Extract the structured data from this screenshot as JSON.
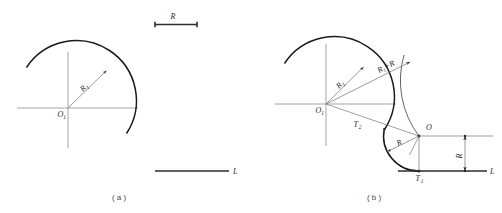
{
  "figure": {
    "watermark": "",
    "captions": {
      "left": "( a )",
      "right": "( b )"
    }
  },
  "panel_a": {
    "name": "given-elements",
    "center_label": "O",
    "center_sub": "1",
    "radius_label": "R",
    "radius_sub": "1",
    "given_radius_label": "R",
    "given_line_label": "L"
  },
  "panel_b": {
    "name": "construction-result",
    "center1_label": "O",
    "center1_sub": "1",
    "center2_label": "O",
    "radius1_label": "R",
    "radius1_sub": "1",
    "sum_radius_label": "R₁+R",
    "radius_label": "R",
    "offset_dim_label": "R",
    "tangent1_label": "T",
    "tangent1_sub": "1",
    "tangent2_label": "T",
    "tangent2_sub": "2",
    "line_label": "L"
  },
  "colors": {
    "arc_primary": "#1a1a1a",
    "axis": "#8d8d8d",
    "leader": "#6f6f6f",
    "dimension": "#2b2b2b",
    "background": "#ffffff"
  }
}
